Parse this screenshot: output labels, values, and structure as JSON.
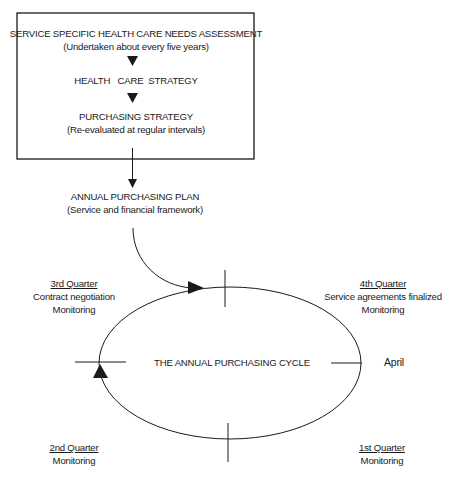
{
  "box": {
    "needs_assessment": "SERVICE SPECIFIC HEALTH CARE NEEDS ASSESSMENT",
    "needs_assessment_note": "(Undertaken about every five years)",
    "health_care_strategy": "HEALTH   CARE  STRATEGY",
    "purchasing_strategy": "PURCHASING STRATEGY",
    "purchasing_strategy_note": "(Re-evaluated at regular intervals)"
  },
  "plan": {
    "title": "ANNUAL PURCHASING PLAN",
    "subtitle": "(Service and financial framework)"
  },
  "cycle": {
    "title": "THE ANNUAL PURCHASING CYCLE",
    "start_label": "April"
  },
  "quarters": {
    "q3": {
      "title": "3rd Quarter",
      "lines": [
        "Contract negotiation",
        "Monitoring"
      ]
    },
    "q4": {
      "title": "4th Quarter",
      "lines": [
        "Service agreements finalized",
        "Monitoring"
      ]
    },
    "q2": {
      "title": "2nd Quarter",
      "lines": [
        "Monitoring"
      ]
    },
    "q1": {
      "title": "1st Quarter",
      "lines": [
        "Monitoring"
      ]
    }
  },
  "colors": {
    "line": "#1a1a1a",
    "background": "#ffffff"
  }
}
